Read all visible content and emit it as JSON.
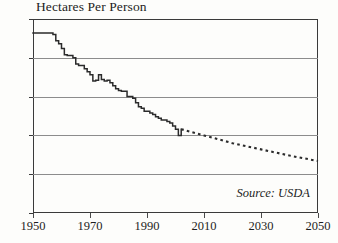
{
  "chart_data": {
    "type": "line",
    "title": "Hectares Per Person",
    "xlabel": "",
    "ylabel": "",
    "xlim": [
      1950,
      2050
    ],
    "ylim": [
      0,
      0.25
    ],
    "grid": true,
    "legend_position": "none",
    "annotations": [
      {
        "name": "source",
        "text": "Source: USDA",
        "style": "italic",
        "position": "bottom-right-inside-plot"
      }
    ],
    "ytick_labels": [
      "0.25",
      "0.20",
      "0.15",
      "0.10",
      "0.05",
      "0"
    ],
    "ytick_values": [
      0.25,
      0.2,
      0.15,
      0.1,
      0.05,
      0
    ],
    "xtick_labels": [
      "1950",
      "1970",
      "1990",
      "2010",
      "2030",
      "2050"
    ],
    "xtick_values": [
      1950,
      1970,
      1990,
      2010,
      2030,
      2050
    ],
    "series": [
      {
        "name": "Grain area per person (historical)",
        "style": "solid",
        "x": [
          1950,
          1951,
          1952,
          1953,
          1954,
          1955,
          1956,
          1957,
          1958,
          1959,
          1960,
          1961,
          1962,
          1963,
          1964,
          1965,
          1966,
          1967,
          1968,
          1969,
          1970,
          1971,
          1972,
          1973,
          1974,
          1975,
          1976,
          1977,
          1978,
          1979,
          1980,
          1981,
          1982,
          1983,
          1984,
          1985,
          1986,
          1987,
          1988,
          1989,
          1990,
          1991,
          1992,
          1993,
          1994,
          1995,
          1996,
          1997,
          1998,
          1999,
          2000,
          2001,
          2002
        ],
        "values": [
          0.232,
          0.232,
          0.232,
          0.232,
          0.232,
          0.232,
          0.232,
          0.23,
          0.222,
          0.218,
          0.212,
          0.204,
          0.203,
          0.203,
          0.2,
          0.192,
          0.19,
          0.19,
          0.186,
          0.182,
          0.178,
          0.17,
          0.171,
          0.178,
          0.172,
          0.17,
          0.171,
          0.168,
          0.164,
          0.16,
          0.158,
          0.157,
          0.157,
          0.15,
          0.15,
          0.148,
          0.142,
          0.137,
          0.135,
          0.131,
          0.131,
          0.129,
          0.127,
          0.124,
          0.122,
          0.12,
          0.12,
          0.118,
          0.116,
          0.112,
          0.108,
          0.1,
          0.108
        ]
      },
      {
        "name": "Grain area per person (projected)",
        "style": "dotted",
        "x": [
          2002,
          2010,
          2020,
          2030,
          2040,
          2050
        ],
        "values": [
          0.108,
          0.1,
          0.09,
          0.082,
          0.074,
          0.067
        ]
      }
    ]
  },
  "colors": {
    "line": "#2b2b2b",
    "grid": "#8c8c8c",
    "frame": "#3a3a3a",
    "text": "#1d1d1d",
    "background": "#fdfdfb"
  }
}
